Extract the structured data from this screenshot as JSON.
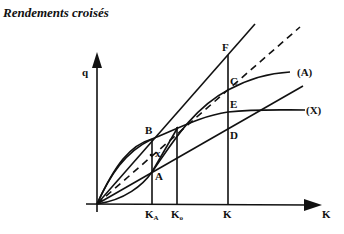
{
  "title": "Rendements croisés",
  "axes": {
    "y_label": "q",
    "x_label": "K"
  },
  "points": {
    "F": "F",
    "C": "C",
    "E": "E",
    "D": "D",
    "B": "B",
    "A": "A",
    "x": "x"
  },
  "curves": {
    "A": "(A)",
    "X": "(X)"
  },
  "ticks": {
    "KA": "K",
    "KA_sub": "A",
    "K0": "K",
    "K0_sub": "o",
    "K": "K"
  }
}
